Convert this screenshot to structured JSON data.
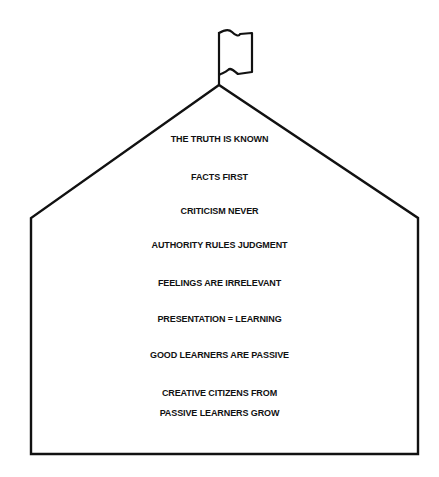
{
  "diagram": {
    "type": "schoolhouse",
    "stroke_color": "#111111",
    "background_color": "#ffffff",
    "flag_icon": "flag-icon",
    "principles": [
      "THE TRUTH IS KNOWN",
      "FACTS FIRST",
      "CRITICISM NEVER",
      "AUTHORITY RULES JUDGMENT",
      "FEELINGS ARE IRRELEVANT",
      "PRESENTATION = LEARNING",
      "GOOD LEARNERS ARE PASSIVE",
      "CREATIVE CITIZENS FROM",
      "PASSIVE LEARNERS GROW"
    ]
  }
}
